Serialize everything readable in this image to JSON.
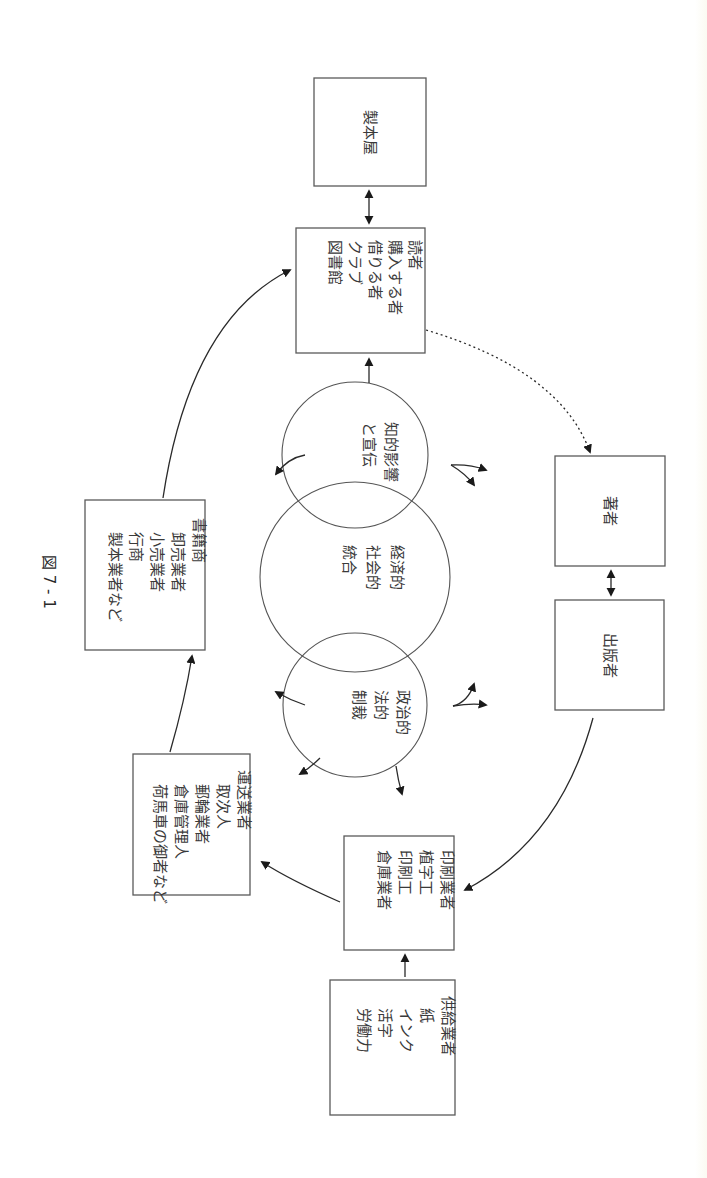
{
  "figure": {
    "label": "図 7 - 1",
    "orientation": "rotated 90° clockwise; vertical Japanese text"
  },
  "boxes": {
    "bookbinder": {
      "lines": [
        "製本屋"
      ]
    },
    "readers": {
      "lines": [
        "読者",
        "購入する者",
        "借りる者",
        "クラブ",
        "図書館"
      ]
    },
    "author": {
      "lines": [
        "著者"
      ]
    },
    "publisher": {
      "lines": [
        "出版者"
      ]
    },
    "printers": {
      "lines": [
        "印刷業者",
        "植字工",
        "印刷工",
        "倉庫業者"
      ]
    },
    "suppliers": {
      "lines": [
        "供給業者",
        "紙",
        "インク",
        "活字",
        "労働力"
      ]
    },
    "distributors": {
      "lines": [
        "運送業者",
        "取次人",
        "郵輪業者",
        "倉庫管理人",
        "荷馬車の御者など"
      ]
    },
    "booksellers": {
      "lines": [
        "書籍商",
        "卸売業者",
        "小売業者",
        "行商",
        "製本業者など"
      ]
    }
  },
  "circles": {
    "intellectual": {
      "lines": [
        "知的影響",
        "と宣伝"
      ]
    },
    "economic": {
      "lines": [
        "経済的",
        "社会的",
        "統合"
      ]
    },
    "political": {
      "lines": [
        "政治的",
        "法的",
        "制裁"
      ]
    }
  }
}
